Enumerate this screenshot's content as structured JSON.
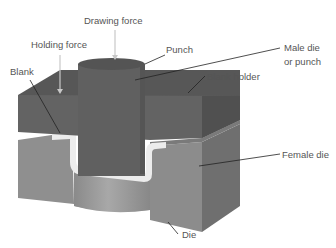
{
  "diagram": {
    "type": "deep drawing die cross-section",
    "colors": {
      "punch": "#5f5f5f",
      "punch_top": "#545454",
      "blank_holder_top": "#565656",
      "blank_holder_front": "#636363",
      "blank_holder_side": "#4f4f4f",
      "female_die_front": "#8e8e8e",
      "female_die_side": "#6e6e6e",
      "female_die_top": "#7c7c7c",
      "die_cavity": "#999999",
      "blank": "#e9e9e9",
      "leader": "#222222",
      "arrow": "#c8c8c8"
    },
    "labels": {
      "drawing_force": "Drawing force",
      "holding_force": "Holding force",
      "punch": "Punch",
      "male_die_line1": "Male die",
      "male_die_line2": "or punch",
      "blank": "Blank",
      "blank_holder": "Blank holder",
      "female_die": "Female die",
      "die": "Die"
    }
  }
}
